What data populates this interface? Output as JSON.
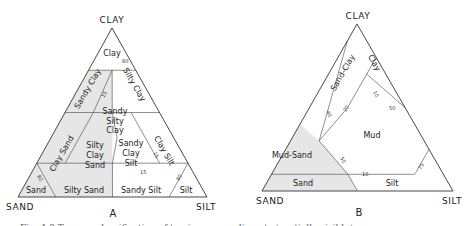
{
  "figure": {
    "caption_partial": "Fig. 4.3 Ternary classification of terrigenous sediments (partially visible)",
    "panels": [
      {
        "id": "A",
        "label": "A",
        "vertices": {
          "top": "CLAY",
          "left": "SAND",
          "right": "SILT"
        },
        "regions": [
          {
            "name": "Clay",
            "lines": [
              "Clay"
            ]
          },
          {
            "name": "Sandy Clay",
            "lines": [
              "Sandy Clay"
            ]
          },
          {
            "name": "Silty Clay",
            "lines": [
              "Silty Clay"
            ]
          },
          {
            "name": "Sandy Silty Clay",
            "lines": [
              "Sandy",
              "Silty",
              "Clay"
            ]
          },
          {
            "name": "Clay Sand",
            "lines": [
              "Clay Sand"
            ]
          },
          {
            "name": "Clay Silt",
            "lines": [
              "Clay Silt"
            ]
          },
          {
            "name": "Silty Clay Sand",
            "lines": [
              "Silty",
              "Clay",
              "Sand"
            ]
          },
          {
            "name": "Sandy Clay Silt",
            "lines": [
              "Sandy",
              "Clay",
              "Silt"
            ]
          },
          {
            "name": "Sand",
            "lines": [
              "Sand"
            ]
          },
          {
            "name": "Silty Sand",
            "lines": [
              "Silty Sand"
            ]
          },
          {
            "name": "Sandy Silt",
            "lines": [
              "Sandy Silt"
            ]
          },
          {
            "name": "Silt",
            "lines": [
              "Silt"
            ]
          }
        ],
        "ticks": [
          "80",
          "15",
          "80",
          "15",
          "15",
          "80"
        ]
      },
      {
        "id": "B",
        "label": "B",
        "vertices": {
          "top": "CLAY",
          "left": "SAND",
          "right": "SILT"
        },
        "regions": [
          {
            "name": "Sand-Clay",
            "lines": [
              "Sand-Clay"
            ]
          },
          {
            "name": "Clay",
            "lines": [
              "Clay"
            ]
          },
          {
            "name": "Mud",
            "lines": [
              "Mud"
            ]
          },
          {
            "name": "Mud-Sand",
            "lines": [
              "Mud-Sand"
            ]
          },
          {
            "name": "Sand",
            "lines": [
              "Sand"
            ]
          },
          {
            "name": "Silt",
            "lines": [
              "Silt"
            ]
          }
        ],
        "ticks": [
          "10",
          "50",
          "40",
          "20",
          "50",
          "10",
          "75"
        ]
      }
    ]
  }
}
